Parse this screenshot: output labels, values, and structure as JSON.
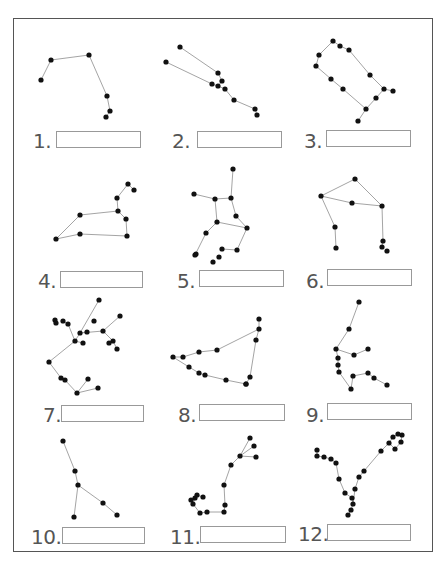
{
  "worksheet": {
    "title": "",
    "colors": {
      "border": "#555555",
      "line": "#9a9a9a",
      "star": "#111111",
      "label": "#555555",
      "box": "#999999"
    },
    "items": [
      {
        "number": "1.",
        "answer": "",
        "label_pos": [
          33,
          131
        ],
        "box": [
          56,
          131,
          85
        ]
      },
      {
        "number": "2.",
        "answer": "",
        "label_pos": [
          172,
          131
        ],
        "box": [
          197,
          131,
          85
        ]
      },
      {
        "number": "3.",
        "answer": "",
        "label_pos": [
          304,
          131
        ],
        "box": [
          326,
          130,
          85
        ]
      },
      {
        "number": "4.",
        "answer": "",
        "label_pos": [
          38,
          271
        ],
        "box": [
          60,
          271,
          83
        ]
      },
      {
        "number": "5.",
        "answer": "",
        "label_pos": [
          177,
          271
        ],
        "box": [
          199,
          270,
          85
        ]
      },
      {
        "number": "6.",
        "answer": "",
        "label_pos": [
          306,
          271
        ],
        "box": [
          327,
          269,
          85
        ]
      },
      {
        "number": "7.",
        "answer": "",
        "label_pos": [
          43,
          405
        ],
        "box": [
          61,
          405,
          83
        ]
      },
      {
        "number": "8.",
        "answer": "",
        "label_pos": [
          178,
          405
        ],
        "box": [
          199,
          404,
          86
        ]
      },
      {
        "number": "9.",
        "answer": "",
        "label_pos": [
          306,
          405
        ],
        "box": [
          327,
          403,
          85
        ]
      },
      {
        "number": "10.",
        "answer": "",
        "label_pos": [
          31,
          527
        ],
        "box": [
          62,
          527,
          83
        ]
      },
      {
        "number": "11.",
        "answer": "",
        "label_pos": [
          170,
          527
        ],
        "box": [
          200,
          526,
          86
        ]
      },
      {
        "number": "12.",
        "answer": "",
        "label_pos": [
          298,
          524
        ],
        "box": [
          327,
          524,
          84
        ]
      }
    ],
    "constellations": [
      {
        "id": 1,
        "stars": [
          [
            41,
            80
          ],
          [
            51,
            60
          ],
          [
            89,
            55
          ],
          [
            107,
            96
          ],
          [
            110,
            111
          ],
          [
            106,
            117
          ]
        ],
        "lines": [
          [
            0,
            1
          ],
          [
            1,
            2
          ],
          [
            2,
            3
          ],
          [
            3,
            4
          ],
          [
            4,
            5
          ]
        ]
      },
      {
        "id": 2,
        "stars": [
          [
            180,
            47
          ],
          [
            166,
            62
          ],
          [
            218,
            73
          ],
          [
            222,
            81
          ],
          [
            212,
            84
          ],
          [
            218,
            86
          ],
          [
            225,
            89
          ],
          [
            234,
            100
          ],
          [
            255,
            109
          ],
          [
            257,
            115
          ]
        ],
        "lines": [
          [
            0,
            2
          ],
          [
            2,
            3
          ],
          [
            3,
            5
          ],
          [
            1,
            4
          ],
          [
            4,
            5
          ],
          [
            5,
            6
          ],
          [
            6,
            7
          ],
          [
            7,
            8
          ],
          [
            8,
            9
          ]
        ]
      },
      {
        "id": 3,
        "stars": [
          [
            333,
            41
          ],
          [
            340,
            46
          ],
          [
            349,
            50
          ],
          [
            319,
            55
          ],
          [
            316,
            66
          ],
          [
            331,
            79
          ],
          [
            343,
            89
          ],
          [
            370,
            75
          ],
          [
            384,
            89
          ],
          [
            393,
            91
          ],
          [
            376,
            98
          ],
          [
            366,
            109
          ],
          [
            358,
            121
          ]
        ],
        "lines": [
          [
            0,
            1
          ],
          [
            1,
            2
          ],
          [
            2,
            7
          ],
          [
            7,
            8
          ],
          [
            8,
            9
          ],
          [
            8,
            10
          ],
          [
            10,
            11
          ],
          [
            11,
            12
          ],
          [
            11,
            6
          ],
          [
            6,
            5
          ],
          [
            5,
            4
          ],
          [
            4,
            3
          ],
          [
            3,
            0
          ]
        ]
      },
      {
        "id": 4,
        "stars": [
          [
            128,
            184
          ],
          [
            134,
            190
          ],
          [
            117,
            198
          ],
          [
            118,
            211
          ],
          [
            126,
            219
          ],
          [
            127,
            236
          ],
          [
            80,
            215
          ],
          [
            80,
            234
          ],
          [
            56,
            239
          ]
        ],
        "lines": [
          [
            0,
            2
          ],
          [
            2,
            3
          ],
          [
            3,
            4
          ],
          [
            4,
            5
          ],
          [
            5,
            7
          ],
          [
            7,
            8
          ],
          [
            8,
            6
          ],
          [
            6,
            3
          ],
          [
            1,
            0
          ]
        ]
      },
      {
        "id": 5,
        "stars": [
          [
            233,
            169
          ],
          [
            194,
            194
          ],
          [
            215,
            199
          ],
          [
            231,
            198
          ],
          [
            236,
            216
          ],
          [
            217,
            222
          ],
          [
            247,
            228
          ],
          [
            206,
            233
          ],
          [
            196,
            254
          ],
          [
            237,
            250
          ],
          [
            222,
            249
          ],
          [
            219,
            257
          ],
          [
            213,
            262
          ],
          [
            195,
            255
          ]
        ],
        "lines": [
          [
            0,
            3
          ],
          [
            3,
            2
          ],
          [
            2,
            1
          ],
          [
            2,
            5
          ],
          [
            3,
            4
          ],
          [
            4,
            6
          ],
          [
            5,
            6
          ],
          [
            5,
            7
          ],
          [
            7,
            13
          ],
          [
            6,
            9
          ],
          [
            9,
            10
          ]
        ]
      },
      {
        "id": 6,
        "stars": [
          [
            355,
            179
          ],
          [
            321,
            196
          ],
          [
            352,
            203
          ],
          [
            382,
            206
          ],
          [
            335,
            227
          ],
          [
            336,
            248
          ],
          [
            383,
            241
          ],
          [
            382,
            247
          ],
          [
            387,
            251
          ]
        ],
        "lines": [
          [
            0,
            1
          ],
          [
            1,
            2
          ],
          [
            2,
            3
          ],
          [
            0,
            3
          ],
          [
            1,
            4
          ],
          [
            4,
            5
          ],
          [
            3,
            6
          ],
          [
            6,
            7
          ]
        ]
      },
      {
        "id": 7,
        "stars": [
          [
            99,
            300
          ],
          [
            120,
            316
          ],
          [
            94,
            321
          ],
          [
            63,
            321
          ],
          [
            55,
            320
          ],
          [
            56,
            323
          ],
          [
            68,
            324
          ],
          [
            80,
            333
          ],
          [
            87,
            332
          ],
          [
            75,
            341
          ],
          [
            83,
            343
          ],
          [
            103,
            331
          ],
          [
            113,
            341
          ],
          [
            109,
            343
          ],
          [
            117,
            349
          ],
          [
            49,
            362
          ],
          [
            61,
            378
          ],
          [
            65,
            380
          ],
          [
            88,
            379
          ],
          [
            77,
            393
          ],
          [
            98,
            388
          ]
        ],
        "lines": [
          [
            0,
            7
          ],
          [
            7,
            8
          ],
          [
            7,
            9
          ],
          [
            9,
            10
          ],
          [
            7,
            11
          ],
          [
            11,
            12
          ],
          [
            12,
            14
          ],
          [
            1,
            11
          ],
          [
            3,
            6
          ],
          [
            6,
            9
          ],
          [
            9,
            15
          ],
          [
            15,
            16
          ],
          [
            16,
            17
          ],
          [
            17,
            19
          ],
          [
            19,
            20
          ],
          [
            19,
            18
          ]
        ]
      },
      {
        "id": 8,
        "stars": [
          [
            259,
            319
          ],
          [
            259,
            329
          ],
          [
            256,
            340
          ],
          [
            217,
            350
          ],
          [
            199,
            352
          ],
          [
            183,
            357
          ],
          [
            173,
            357
          ],
          [
            189,
            367
          ],
          [
            199,
            373
          ],
          [
            205,
            375
          ],
          [
            226,
            380
          ],
          [
            246,
            384
          ],
          [
            246,
            384
          ],
          [
            250,
            377
          ]
        ],
        "lines": [
          [
            1,
            3
          ],
          [
            3,
            4
          ],
          [
            4,
            5
          ],
          [
            5,
            6
          ],
          [
            6,
            7
          ],
          [
            7,
            8
          ],
          [
            8,
            9
          ],
          [
            9,
            10
          ],
          [
            10,
            11
          ],
          [
            11,
            13
          ],
          [
            13,
            2
          ],
          [
            2,
            1
          ],
          [
            0,
            1
          ]
        ]
      },
      {
        "id": 9,
        "stars": [
          [
            359,
            302
          ],
          [
            349,
            329
          ],
          [
            336,
            349
          ],
          [
            354,
            355
          ],
          [
            368,
            349
          ],
          [
            338,
            358
          ],
          [
            338,
            365
          ],
          [
            339,
            372
          ],
          [
            353,
            376
          ],
          [
            368,
            373
          ],
          [
            374,
            378
          ],
          [
            387,
            385
          ],
          [
            351,
            389
          ]
        ],
        "lines": [
          [
            0,
            1
          ],
          [
            1,
            2
          ],
          [
            2,
            3
          ],
          [
            3,
            4
          ],
          [
            2,
            5
          ],
          [
            5,
            6
          ],
          [
            6,
            7
          ],
          [
            7,
            12
          ],
          [
            12,
            8
          ],
          [
            8,
            9
          ],
          [
            9,
            10
          ],
          [
            10,
            11
          ]
        ]
      },
      {
        "id": 10,
        "stars": [
          [
            63,
            441
          ],
          [
            75,
            471
          ],
          [
            78,
            485
          ],
          [
            103,
            503
          ],
          [
            117,
            515
          ],
          [
            74,
            517
          ]
        ],
        "lines": [
          [
            0,
            1
          ],
          [
            1,
            2
          ],
          [
            2,
            3
          ],
          [
            3,
            4
          ],
          [
            2,
            5
          ]
        ]
      },
      {
        "id": 11,
        "stars": [
          [
            250,
            438
          ],
          [
            254,
            446
          ],
          [
            240,
            456
          ],
          [
            256,
            457
          ],
          [
            231,
            465
          ],
          [
            224,
            485
          ],
          [
            225,
            505
          ],
          [
            224,
            512
          ],
          [
            207,
            512
          ],
          [
            200,
            513
          ],
          [
            193,
            504
          ],
          [
            195,
            498
          ],
          [
            203,
            497
          ],
          [
            197,
            495
          ],
          [
            191,
            500
          ]
        ],
        "lines": [
          [
            0,
            2
          ],
          [
            1,
            2
          ],
          [
            3,
            2
          ],
          [
            2,
            4
          ],
          [
            4,
            5
          ],
          [
            5,
            6
          ],
          [
            6,
            7
          ],
          [
            7,
            8
          ],
          [
            8,
            9
          ],
          [
            9,
            10
          ],
          [
            10,
            11
          ],
          [
            11,
            13
          ],
          [
            13,
            12
          ]
        ]
      },
      {
        "id": 12,
        "stars": [
          [
            317,
            450
          ],
          [
            317,
            456
          ],
          [
            324,
            457
          ],
          [
            331,
            459
          ],
          [
            336,
            463
          ],
          [
            339,
            479
          ],
          [
            345,
            493
          ],
          [
            352,
            498
          ],
          [
            353,
            504
          ],
          [
            351,
            510
          ],
          [
            348,
            515
          ],
          [
            355,
            489
          ],
          [
            359,
            477
          ],
          [
            364,
            471
          ],
          [
            381,
            451
          ],
          [
            389,
            443
          ],
          [
            393,
            437
          ],
          [
            398,
            434
          ],
          [
            402,
            435
          ],
          [
            401,
            442
          ],
          [
            395,
            449
          ]
        ],
        "lines": [
          [
            0,
            1
          ],
          [
            1,
            2
          ],
          [
            2,
            3
          ],
          [
            3,
            4
          ],
          [
            4,
            5
          ],
          [
            5,
            6
          ],
          [
            6,
            7
          ],
          [
            7,
            8
          ],
          [
            8,
            9
          ],
          [
            9,
            10
          ],
          [
            8,
            11
          ],
          [
            11,
            12
          ],
          [
            12,
            13
          ],
          [
            13,
            14
          ],
          [
            14,
            15
          ],
          [
            15,
            16
          ],
          [
            16,
            17
          ],
          [
            17,
            18
          ],
          [
            18,
            19
          ],
          [
            19,
            20
          ],
          [
            20,
            15
          ]
        ]
      }
    ]
  }
}
